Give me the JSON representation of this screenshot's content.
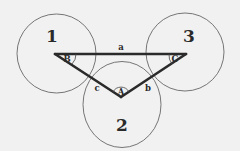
{
  "diagram": {
    "colors": {
      "background": "#f1f1f1",
      "stroke": "#2a2a2a",
      "circle": "#555555"
    },
    "circles": [
      {
        "id": "1",
        "label": "1",
        "cx": 56.5,
        "cy": 53.5,
        "r": 39.5,
        "label_x": 52,
        "label_y": 42
      },
      {
        "id": "2",
        "label": "2",
        "cx": 122,
        "cy": 104.5,
        "r": 40.5,
        "label_x": 122,
        "label_y": 130
      },
      {
        "id": "3",
        "label": "3",
        "cx": 185,
        "cy": 52,
        "r": 39,
        "label_x": 189,
        "label_y": 42
      }
    ],
    "triangle": {
      "vertices": {
        "B": {
          "x": 55,
          "y": 54,
          "angle_label": "B"
        },
        "C": {
          "x": 186,
          "y": 54,
          "angle_label": "C"
        },
        "A": {
          "x": 121,
          "y": 97,
          "angle_label": "A"
        }
      },
      "sides": {
        "a": {
          "label": "a",
          "from": "B",
          "to": "C"
        },
        "b": {
          "label": "b",
          "from": "A",
          "to": "C"
        },
        "c": {
          "label": "c",
          "from": "B",
          "to": "A"
        }
      }
    }
  }
}
